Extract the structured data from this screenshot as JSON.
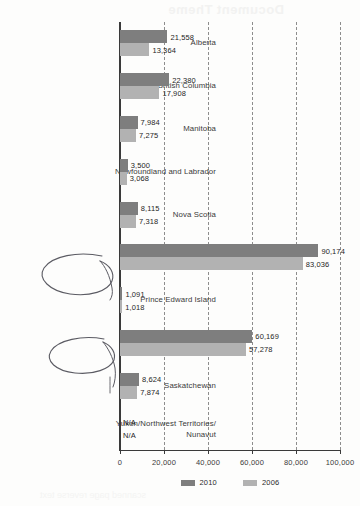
{
  "document": {
    "bleed_through_top": "Document Theme",
    "bleed_through_bottom": "scanned page reverse text"
  },
  "chart_data": {
    "type": "bar",
    "orientation": "horizontal",
    "title": "",
    "xlabel": "",
    "ylabel": "",
    "xlim": [
      0,
      100000
    ],
    "grid": true,
    "grid_style": "dashed-vertical",
    "legend_position": "bottom-center",
    "categories": [
      "Alberta",
      "British Columbia",
      "Manitoba",
      "Newfoundland and Labrador",
      "Nova Scotia",
      "Ontario",
      "Prince Edward Island",
      "Québec",
      "Saskatchewan",
      "Yukon/Northwest Territories/ Nunavut"
    ],
    "category_lines": [
      [
        "Alberta"
      ],
      [
        "British Columbia"
      ],
      [
        "Manitoba"
      ],
      [
        "Newfoundland and Labrador"
      ],
      [
        "Nova Scotia"
      ],
      [
        "Ontario"
      ],
      [
        "Prince Edward Island"
      ],
      [
        "Québec"
      ],
      [
        "Saskatchewan"
      ],
      [
        "Yukon/Northwest Territories/",
        "Nunavut"
      ]
    ],
    "series": [
      {
        "name": "2010",
        "color": "#7e7e7e",
        "values": [
          21558,
          22380,
          7984,
          3500,
          8115,
          90174,
          1091,
          60169,
          8624,
          null
        ],
        "labels": [
          "21,558",
          "22,380",
          "7,984",
          "3,500",
          "8,115",
          "90,174",
          "1,091",
          "60,169",
          "8,624",
          "N/A"
        ]
      },
      {
        "name": "2006",
        "color": "#b2b2b2",
        "values": [
          13364,
          17908,
          7275,
          3068,
          7318,
          83036,
          1018,
          57278,
          7874,
          null
        ],
        "labels": [
          "13,364",
          "17,908",
          "7,275",
          "3,068",
          "7,318",
          "83,036",
          "1,018",
          "57,278",
          "7,874",
          "N/A"
        ]
      }
    ],
    "xticks": [
      0,
      20000,
      40000,
      60000,
      80000,
      100000
    ],
    "xtick_labels": [
      "0",
      "20,000",
      "40,000",
      "60,000",
      "80,000",
      "100,000"
    ],
    "legend": [
      {
        "label": "2010",
        "color": "#7e7e7e"
      },
      {
        "label": "2006",
        "color": "#b2b2b2"
      }
    ],
    "annotations": [
      {
        "kind": "handwritten-ellipse",
        "target": "Ontario"
      },
      {
        "kind": "handwritten-ellipse",
        "target": "Québec"
      }
    ]
  }
}
